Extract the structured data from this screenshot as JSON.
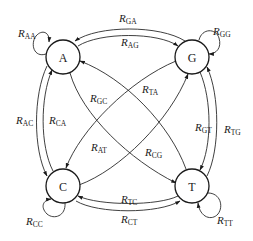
{
  "diagram": {
    "type": "state-transition",
    "nodes": [
      {
        "id": "A",
        "label": "A"
      },
      {
        "id": "G",
        "label": "G"
      },
      {
        "id": "C",
        "label": "C"
      },
      {
        "id": "T",
        "label": "T"
      }
    ],
    "rate_symbol": "R",
    "edges": [
      {
        "from": "A",
        "to": "A",
        "sub": "AA"
      },
      {
        "from": "G",
        "to": "G",
        "sub": "GG"
      },
      {
        "from": "C",
        "to": "C",
        "sub": "CC"
      },
      {
        "from": "T",
        "to": "T",
        "sub": "TT"
      },
      {
        "from": "G",
        "to": "A",
        "sub": "GA"
      },
      {
        "from": "A",
        "to": "G",
        "sub": "AG"
      },
      {
        "from": "A",
        "to": "C",
        "sub": "AC"
      },
      {
        "from": "C",
        "to": "A",
        "sub": "CA"
      },
      {
        "from": "G",
        "to": "T",
        "sub": "GT"
      },
      {
        "from": "T",
        "to": "G",
        "sub": "TG"
      },
      {
        "from": "T",
        "to": "C",
        "sub": "TC"
      },
      {
        "from": "C",
        "to": "T",
        "sub": "CT"
      },
      {
        "from": "G",
        "to": "C",
        "sub": "GC"
      },
      {
        "from": "T",
        "to": "A",
        "sub": "TA"
      },
      {
        "from": "A",
        "to": "T",
        "sub": "AT"
      },
      {
        "from": "C",
        "to": "G",
        "sub": "CG"
      }
    ]
  }
}
